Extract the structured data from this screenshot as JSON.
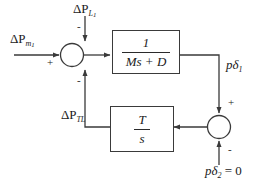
{
  "diagram": {
    "type": "control-block-diagram",
    "stroke_color": "#3a3a3a",
    "text_color": "#1a1a1a",
    "background": "#ffffff"
  },
  "inputs": {
    "mechanical_power": {
      "base": "ΔP",
      "sub": "m",
      "sub2": "1"
    },
    "load_disturbance": {
      "base": "ΔP",
      "sub": "L",
      "sub2": "1"
    },
    "second_area_angle": {
      "text": "pδ",
      "sub": "2",
      "equals": " = 0"
    }
  },
  "signals": {
    "tie_line_power": {
      "base": "ΔP",
      "sub": "TL"
    },
    "angle_output": {
      "text": "pδ",
      "sub": "1"
    }
  },
  "blocks": [
    {
      "name": "swing-equation-block",
      "numerator": "1",
      "denominator": "Ms + D"
    },
    {
      "name": "tie-line-block",
      "numerator": "T",
      "denominator": "s"
    }
  ],
  "summing_junctions": [
    {
      "name": "left-summing-junction",
      "signs": {
        "left_input": "+",
        "top_input": "-",
        "bottom_input": "-"
      }
    },
    {
      "name": "right-summing-junction",
      "signs": {
        "top_input": "+",
        "bottom_input": "-"
      }
    }
  ]
}
